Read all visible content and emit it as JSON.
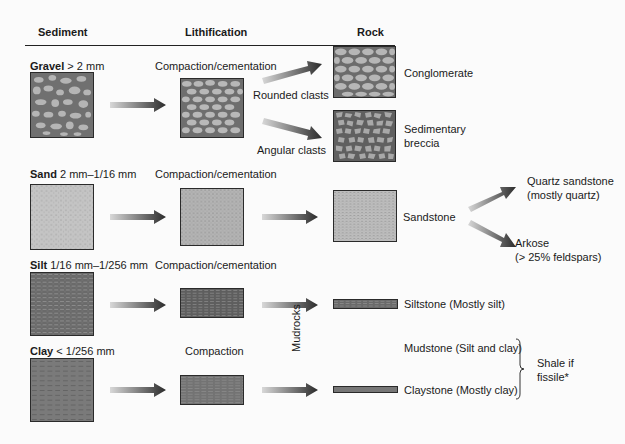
{
  "headers": {
    "sediment": "Sediment",
    "lithification": "Lithification",
    "rock": "Rock"
  },
  "rows": [
    {
      "sediment_name": "Gravel",
      "sediment_size": "> 2 mm",
      "process": "Compaction/cementation"
    },
    {
      "sediment_name": "Sand",
      "sediment_size": "2 mm–1/16 mm",
      "process": "Compaction/cementation"
    },
    {
      "sediment_name": "Silt",
      "sediment_size": "1/16 mm–1/256 mm",
      "process": "Compaction/cementation"
    },
    {
      "sediment_name": "Clay",
      "sediment_size": "< 1/256 mm",
      "process": "Compaction"
    }
  ],
  "branches": {
    "rounded": "Rounded clasts",
    "angular": "Angular clasts"
  },
  "rocks": {
    "conglomerate": "Conglomerate",
    "breccia_line1": "Sedimentary",
    "breccia_line2": "breccia",
    "sandstone": "Sandstone",
    "quartz_sandstone_line1": "Quartz sandstone",
    "quartz_sandstone_line2": "(mostly quartz)",
    "arkose_line1": "Arkose",
    "arkose_line2": "(> 25% feldspars)",
    "siltstone": "Siltstone",
    "siltstone_note": "(Mostly silt)",
    "mudstone": "Mudstone",
    "mudstone_note": "(Silt and clay)",
    "claystone": "Claystone",
    "claystone_note": "(Mostly clay)"
  },
  "group_label": "Mudrocks",
  "shale_line1": "Shale if",
  "shale_line2": "fissile*",
  "colors": {
    "texture_dark": "#6e6e6e",
    "texture_light": "#b8b8b8",
    "arrow_dark": "#2b2b2b",
    "arrow_light": "#d8d8d8"
  }
}
